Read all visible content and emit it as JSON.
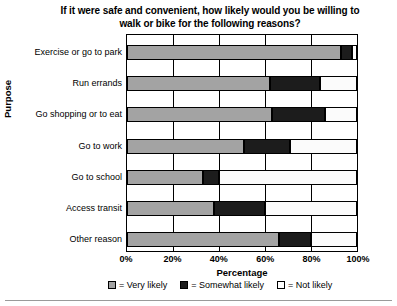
{
  "chart_data": {
    "type": "bar",
    "orientation": "horizontal",
    "stacked": true,
    "title": "If it were safe and convenient, how likely would you be willing to walk or bike for the following reasons?",
    "title_lines": [
      "If it were safe and convenient, how likely would you be willing to",
      "walk or bike for the following reasons?"
    ],
    "xlabel": "Percentage",
    "ylabel": "Purpose",
    "xlim": [
      0,
      100
    ],
    "grid": true,
    "legend_position": "bottom",
    "xticks": [
      "0%",
      "20%",
      "40%",
      "60%",
      "80%",
      "100%"
    ],
    "xtick_values": [
      0,
      20,
      40,
      60,
      80,
      100
    ],
    "categories": [
      "Exercise or go to park",
      "Run errands",
      "Go shopping or to eat",
      "Go to work",
      "Go to school",
      "Access transit",
      "Other reason"
    ],
    "series": [
      {
        "name": "Very likely",
        "color": "#a3a3a3",
        "values": [
          93,
          62,
          63,
          51,
          33,
          38,
          66
        ]
      },
      {
        "name": "Somewhat likely",
        "color": "#1c1c1c",
        "values": [
          5,
          22,
          23,
          20,
          7,
          22,
          14
        ]
      },
      {
        "name": "Not likely",
        "color": "#ffffff",
        "values": [
          2,
          16,
          14,
          29,
          60,
          40,
          20
        ]
      }
    ],
    "legend": [
      {
        "label": "= Very likely",
        "color": "#a3a3a3"
      },
      {
        "label": "= Somewhat likely",
        "color": "#1c1c1c"
      },
      {
        "label": "= Not likely",
        "color": "#ffffff"
      }
    ]
  }
}
